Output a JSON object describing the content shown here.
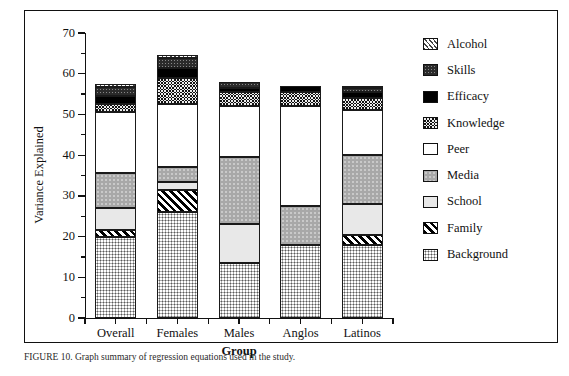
{
  "caption": "FIGURE 10. Graph summary of regression equations used in the study.",
  "chart_data": {
    "type": "bar",
    "subtype": "stacked-bar",
    "title": "",
    "xlabel": "Group",
    "ylabel": "Variance Explained",
    "ylim": [
      0,
      70
    ],
    "ytick_step": 10,
    "yticks": [
      0,
      10,
      20,
      30,
      40,
      50,
      60,
      70
    ],
    "ytick_labels": [
      "0",
      "10",
      "20",
      "30",
      "40",
      "50",
      "60",
      "70"
    ],
    "minor_ticks": true,
    "grid": false,
    "legend_position": "right",
    "categories": [
      "Overall",
      "Females",
      "Males",
      "Anglos",
      "Latinos"
    ],
    "legend_order": [
      "Alcohol",
      "Skills",
      "Efficacy",
      "Knowledge",
      "Peer",
      "Media",
      "School",
      "Family",
      "Background"
    ],
    "stack_order": [
      "Background",
      "Family",
      "School",
      "Media",
      "Peer",
      "Knowledge",
      "Efficacy",
      "Skills",
      "Alcohol"
    ],
    "series": [
      {
        "name": "Background",
        "pattern": "fine-dotted-grid",
        "values": [
          20.0,
          26.0,
          13.5,
          18.0,
          18.0
        ]
      },
      {
        "name": "Family",
        "pattern": "diagonal-hatch",
        "values": [
          1.5,
          5.5,
          0.0,
          0.0,
          2.5
        ]
      },
      {
        "name": "School",
        "pattern": "light-gray-solid",
        "values": [
          5.5,
          2.0,
          9.5,
          0.0,
          7.5
        ]
      },
      {
        "name": "Media",
        "pattern": "medium-gray",
        "values": [
          8.5,
          3.5,
          16.5,
          9.5,
          12.0
        ]
      },
      {
        "name": "Peer",
        "pattern": "white-solid",
        "values": [
          15.0,
          15.5,
          12.5,
          24.5,
          11.0
        ]
      },
      {
        "name": "Knowledge",
        "pattern": "checkerboard",
        "values": [
          2.0,
          6.5,
          3.5,
          3.5,
          3.0
        ]
      },
      {
        "name": "Efficacy",
        "pattern": "black-solid",
        "values": [
          2.0,
          2.5,
          1.0,
          1.5,
          1.5
        ]
      },
      {
        "name": "Skills",
        "pattern": "dark-stipple",
        "values": [
          2.3,
          2.3,
          1.5,
          0.0,
          1.0
        ]
      },
      {
        "name": "Alcohol",
        "pattern": "fine-diagonal",
        "values": [
          0.7,
          0.7,
          0.0,
          0.0,
          0.5
        ]
      }
    ],
    "totals": [
      57.5,
      64.5,
      58.0,
      57.0,
      57.0
    ]
  }
}
